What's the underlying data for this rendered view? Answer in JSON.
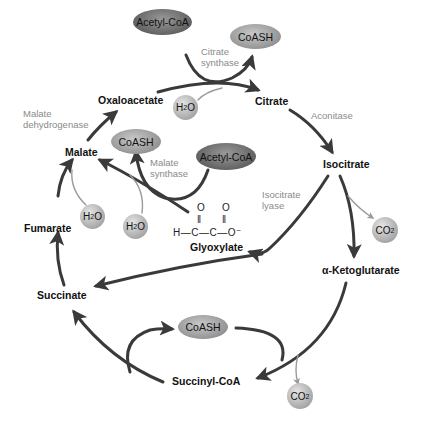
{
  "metabolites": {
    "oxaloacetate": "Oxaloacetate",
    "citrate": "Citrate",
    "isocitrate": "Isocitrate",
    "alpha_ketoglutarate": "α-Ketoglutarate",
    "succinyl_coa": "Succinyl-CoA",
    "succinate": "Succinate",
    "fumarate": "Fumarate",
    "malate": "Malate",
    "glyoxylate": "Glyoxylate"
  },
  "enzymes": {
    "citrate_synthase": [
      "Citrate",
      "synthase"
    ],
    "aconitase": "Aconitase",
    "isocitrate_lyase": [
      "Isocitrate",
      "lyase"
    ],
    "malate_synthase": [
      "Malate",
      "synthase"
    ],
    "malate_dehydrogenase": [
      "Malate",
      "dehydrogenase"
    ]
  },
  "cofactors": {
    "acetyl_coa_top": "Acetyl-CoA",
    "coash_top": "CoASH",
    "acetyl_coa_mid": "Acetyl-CoA",
    "coash_mid": "CoASH",
    "coash_bottom": "CoASH"
  },
  "small_molecules": {
    "h2o_citrate": {
      "base": "H",
      "sub": "2",
      "tail": "O"
    },
    "h2o_fumarate": {
      "base": "H",
      "sub": "2",
      "tail": "O"
    },
    "h2o_malate_synthase": {
      "base": "H",
      "sub": "2",
      "tail": "O"
    },
    "co2_isocitrate": {
      "base": "CO",
      "sub": "2",
      "tail": ""
    },
    "co2_ketoglutarate": {
      "base": "CO",
      "sub": "2",
      "tail": ""
    }
  },
  "glyoxylate_structure": {
    "o1": "O",
    "o2": "O",
    "dbl1": "‖",
    "dbl2": "‖",
    "chain": "H—C—C—O⁻"
  },
  "colors": {
    "arrow_main": "#3a3a3a",
    "arrow_minor": "#9a9a9a",
    "enzyme_text": "#8a8a8a",
    "metabolite_text": "#111111"
  }
}
